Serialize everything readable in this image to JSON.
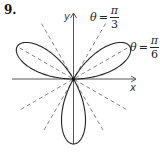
{
  "problem": {
    "number": "9."
  },
  "axes": {
    "x_label": "x",
    "y_label": "y"
  },
  "annotations": [
    {
      "theta": "θ",
      "equals": "=",
      "numerator": "π",
      "denominator": "3"
    },
    {
      "theta": "θ",
      "equals": "=",
      "numerator": "π",
      "denominator": "6"
    }
  ],
  "curve": {
    "type": "polar rose",
    "petals": 3,
    "petal_directions_deg": [
      30,
      150,
      270
    ],
    "stroke_color": "#222222"
  },
  "guide_lines": {
    "style": "dashed",
    "angles_deg": [
      30,
      60,
      120,
      150
    ],
    "color": "#555555"
  }
}
